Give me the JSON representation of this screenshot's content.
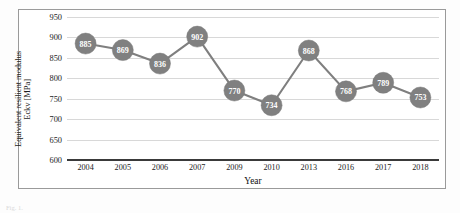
{
  "figure": {
    "frame_border_color": "#9a9a9a",
    "background_color": "#ffffff",
    "caption_fragment": "Fig. 1."
  },
  "chart_data": {
    "type": "line",
    "title": "",
    "subtitle": "",
    "xlabel": "Year",
    "ylabel": "Equivalent resilient modulus",
    "ylabel_line2": "Eckv [MPa]",
    "categories": [
      "2004",
      "2005",
      "2006",
      "2007",
      "2009",
      "2010",
      "2013",
      "2016",
      "2017",
      "2018"
    ],
    "values": [
      885,
      869,
      836,
      902,
      770,
      734,
      868,
      768,
      789,
      753
    ],
    "data_labels": [
      "885",
      "869",
      "836",
      "902",
      "770",
      "734",
      "868",
      "768",
      "789",
      "753"
    ],
    "ylim": [
      600,
      950
    ],
    "yticks": [
      600,
      650,
      700,
      750,
      800,
      850,
      900,
      950
    ],
    "ytick_labels": [
      "600",
      "650",
      "700",
      "750",
      "800",
      "850",
      "900",
      "950"
    ],
    "grid": true,
    "grid_color": "#d8d8d8",
    "legend": "none",
    "series": [
      {
        "name": "Equivalent resilient modulus Eckv [MPa]",
        "values": [
          885,
          869,
          836,
          902,
          770,
          734,
          868,
          768,
          789,
          753
        ],
        "line_color": "#7f7f7f",
        "marker_color": "#808080",
        "marker_label_color": "#ffffff",
        "marker_shape": "circle"
      }
    ],
    "axis_line_color": "#3a3a3a"
  }
}
